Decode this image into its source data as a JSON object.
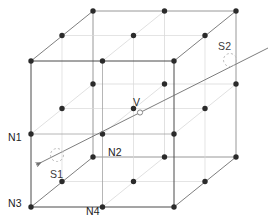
{
  "figure": {
    "width": 273,
    "height": 223,
    "background_color": "#ffffff"
  },
  "colors": {
    "edge_front": "#4a4a4a",
    "edge_back": "#8d8d8d",
    "grid_line": "#c9c9c9",
    "grid_line_faint": "#dcdcdc",
    "node_fill": "#2b2b2b",
    "ray_line": "#6e6e6e",
    "sample_circle": "#b4b4b4",
    "voxel_marker": "#7a7a7a",
    "label_text": "#1c1c1c"
  },
  "labels": {
    "n1": "N1",
    "n2": "N2",
    "n3": "N3",
    "n4": "N4",
    "s1": "S1",
    "s2": "S2",
    "v": "V"
  },
  "geometry": {
    "projection": "oblique",
    "cells_per_axis": 2,
    "nodes_per_axis": 3,
    "origin_front_bottom_left": [
      31,
      207
    ],
    "x_step": [
      71.5,
      0
    ],
    "y_step": [
      0,
      -73
    ],
    "depth_step": [
      31,
      -24.5
    ]
  },
  "ray": {
    "start_label": "S1",
    "end_label": "S2",
    "start_point": [
      39,
      163
    ],
    "end_point": [
      268,
      48
    ],
    "has_arrowhead_at_start": true,
    "intersection_label": "V",
    "intersection_point": [
      140,
      113
    ]
  },
  "label_positions": {
    "n1": [
      10,
      137
    ],
    "n2": [
      108,
      152
    ],
    "n3": [
      10,
      203
    ],
    "n4": [
      88,
      213
    ],
    "s1": [
      52,
      175
    ],
    "s2": [
      221,
      47
    ],
    "v": [
      133,
      101
    ]
  },
  "sample_circles": [
    {
      "name": "S1",
      "center": [
        57,
        156
      ],
      "r": 6.5
    },
    {
      "name": "S2",
      "center": [
        230,
        60
      ],
      "r": 6.5
    }
  ]
}
